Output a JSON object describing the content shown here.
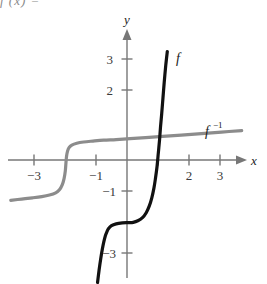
{
  "figure": {
    "top_fragment": "f  (x)   =",
    "axis": {
      "x_label": "x",
      "y_label": "y",
      "x_ticks": [
        {
          "value": -3,
          "label": "−3"
        },
        {
          "value": -2,
          "label": ""
        },
        {
          "value": -1,
          "label": "−1"
        },
        {
          "value": 1,
          "label": ""
        },
        {
          "value": 2,
          "label": "2"
        },
        {
          "value": 3,
          "label": "3"
        }
      ],
      "y_ticks": [
        {
          "value": 3,
          "label": "3"
        },
        {
          "value": 2,
          "label": "2"
        },
        {
          "value": -1,
          "label": "−1"
        },
        {
          "value": -3,
          "label": "−3"
        }
      ]
    },
    "curves": [
      {
        "name": "f",
        "label": "f",
        "label_sup": "",
        "color": "#111111",
        "width": 3.2,
        "description": "steep cubic-like curve, plateau near y = -2 between x = -0.6 and x = 0.3, rises near-vertically through x = 1"
      },
      {
        "name": "f-inverse",
        "label": "f",
        "label_sup": "−1",
        "color": "#8c8c8c",
        "width": 3.2,
        "description": "reflection of f across y = x, plateau near x = -2 rising vertically, flat wings at y = -1.2 left and y = 0.6 right"
      }
    ]
  },
  "chart_data": {
    "type": "line",
    "title": "",
    "xlabel": "x",
    "ylabel": "y",
    "xlim": [
      -3.75,
      3.75
    ],
    "ylim": [
      -3.9,
      3.6
    ],
    "grid": false,
    "legend": "inline-curve-labels",
    "xticks": [
      -3,
      -2,
      -1,
      1,
      2,
      3
    ],
    "xticklabels": [
      "−3",
      "",
      "−1",
      "",
      "2",
      "3"
    ],
    "yticks": [
      3,
      2,
      -1,
      -3
    ],
    "yticklabels": [
      "3",
      "2",
      "−1",
      "−3"
    ],
    "series": [
      {
        "name": "f",
        "color": "#111111",
        "points": [
          [
            -0.95,
            -3.95
          ],
          [
            -0.9,
            -3.55
          ],
          [
            -0.85,
            -3.2
          ],
          [
            -0.8,
            -2.9
          ],
          [
            -0.75,
            -2.65
          ],
          [
            -0.7,
            -2.45
          ],
          [
            -0.65,
            -2.32
          ],
          [
            -0.6,
            -2.22
          ],
          [
            -0.5,
            -2.12
          ],
          [
            -0.35,
            -2.06
          ],
          [
            -0.15,
            -2.03
          ],
          [
            0.05,
            -2.02
          ],
          [
            0.2,
            -2.01
          ],
          [
            0.35,
            -1.96
          ],
          [
            0.5,
            -1.86
          ],
          [
            0.62,
            -1.7
          ],
          [
            0.72,
            -1.48
          ],
          [
            0.8,
            -1.22
          ],
          [
            0.87,
            -0.9
          ],
          [
            0.92,
            -0.58
          ],
          [
            0.97,
            -0.2
          ],
          [
            1.01,
            0.22
          ],
          [
            1.05,
            0.65
          ],
          [
            1.08,
            1.05
          ],
          [
            1.12,
            1.5
          ],
          [
            1.16,
            2.0
          ],
          [
            1.2,
            2.5
          ],
          [
            1.25,
            3.05
          ],
          [
            1.3,
            3.5
          ]
        ]
      },
      {
        "name": "f-inverse",
        "color": "#8c8c8c",
        "points": [
          [
            -3.75,
            -1.3
          ],
          [
            -3.4,
            -1.26
          ],
          [
            -3.05,
            -1.22
          ],
          [
            -2.75,
            -1.18
          ],
          [
            -2.5,
            -1.13
          ],
          [
            -2.3,
            -1.06
          ],
          [
            -2.18,
            -0.96
          ],
          [
            -2.09,
            -0.8
          ],
          [
            -2.03,
            -0.6
          ],
          [
            -1.99,
            -0.35
          ],
          [
            -1.97,
            -0.1
          ],
          [
            -1.95,
            0.12
          ],
          [
            -1.92,
            0.28
          ],
          [
            -1.87,
            0.4
          ],
          [
            -1.78,
            0.48
          ],
          [
            -1.62,
            0.54
          ],
          [
            -1.4,
            0.58
          ],
          [
            -1.1,
            0.61
          ],
          [
            -0.75,
            0.64
          ],
          [
            -0.35,
            0.66
          ],
          [
            0.1,
            0.69
          ],
          [
            0.6,
            0.72
          ],
          [
            1.15,
            0.76
          ],
          [
            1.75,
            0.8
          ],
          [
            2.4,
            0.85
          ],
          [
            3.05,
            0.9
          ],
          [
            3.7,
            0.95
          ]
        ]
      }
    ]
  }
}
